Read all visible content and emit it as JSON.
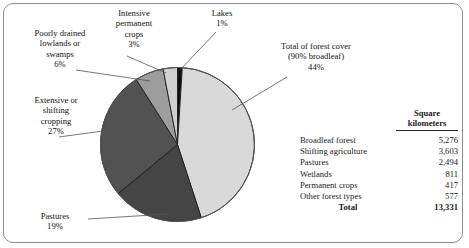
{
  "chart_data": {
    "type": "pie",
    "title": "",
    "categories": [
      "Lakes",
      "Total of forest cover (90% broadleaf)",
      "Pastures",
      "Extensive or shifting cropping",
      "Poorly drained lowlands or swamps",
      "Intensive permanent crops"
    ],
    "values": [
      1,
      44,
      19,
      27,
      6,
      3
    ],
    "value_unit": "percent",
    "colors": [
      "#111111",
      "#d9d9d9",
      "#454545",
      "#525252",
      "#9d9d9d",
      "#d0d0d0"
    ],
    "start_angle_deg": 0,
    "direction": "clockwise",
    "legend": "none",
    "labels_as_callouts": true,
    "table": {
      "header_blank": "",
      "header_value_line1": "Square",
      "header_value_line2": "kilometers",
      "rows": [
        {
          "name": "Broadleaf forest",
          "value": "5,276"
        },
        {
          "name": "Shifting agriculture",
          "value": "3,603"
        },
        {
          "name": "Pastures",
          "value": "2,494"
        },
        {
          "name": "Wetlands",
          "value": "811"
        },
        {
          "name": "Permanent crops",
          "value": "417"
        },
        {
          "name": "Other forest types",
          "value": "577"
        }
      ],
      "total_label": "Total",
      "total_value": "13,331"
    }
  },
  "callouts": {
    "poorly_drained": {
      "line1": "Poorly drained",
      "line2": "lowlands or",
      "line3": "swamps",
      "line4": "6%"
    },
    "intensive_permanent_crops": {
      "line1": "Intensive",
      "line2": "permanent",
      "line3": "crops",
      "line4": "3%"
    },
    "lakes": {
      "line1": "Lakes",
      "line2": "1%"
    },
    "forest_cover": {
      "line1": "Total of forest cover",
      "line2": "(90% broadleaf)",
      "line3": "44%"
    },
    "extensive_shifting": {
      "line1": "Extensive or",
      "line2": "shifting",
      "line3": "cropping",
      "line4": "27%"
    },
    "pastures": {
      "line1": "Pastures",
      "line2": "19%"
    }
  }
}
